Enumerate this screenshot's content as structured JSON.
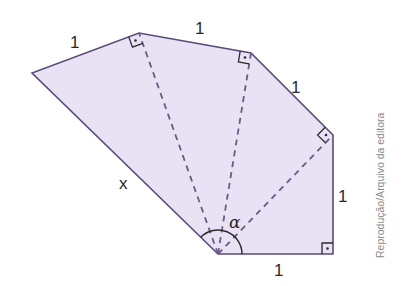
{
  "figure": {
    "type": "polygon-fan-diagram",
    "fill_color": "#e9e1f4",
    "edge_color": "#5a4a78",
    "dash_color": "#6a5a86",
    "vertices": [
      [
        218,
        254
      ],
      [
        32,
        73
      ],
      [
        139,
        33
      ],
      [
        251,
        53
      ],
      [
        333,
        135
      ],
      [
        333,
        254
      ]
    ],
    "apex": [
      218,
      254
    ],
    "diagonals_to": [
      [
        139,
        33
      ],
      [
        251,
        53
      ],
      [
        333,
        135
      ]
    ],
    "right_angle_marks": [
      "top-left-vertex",
      "top-right-vertex",
      "right-upper-vertex",
      "bottom-right-vertex"
    ]
  },
  "labels": {
    "edge_top_left": "1",
    "edge_top": "1",
    "edge_upper_right": "1",
    "edge_right": "1",
    "edge_bottom": "1",
    "edge_hypotenuse": "x",
    "angle": "α"
  },
  "credit": "Reprodução/Arquivo da editora"
}
